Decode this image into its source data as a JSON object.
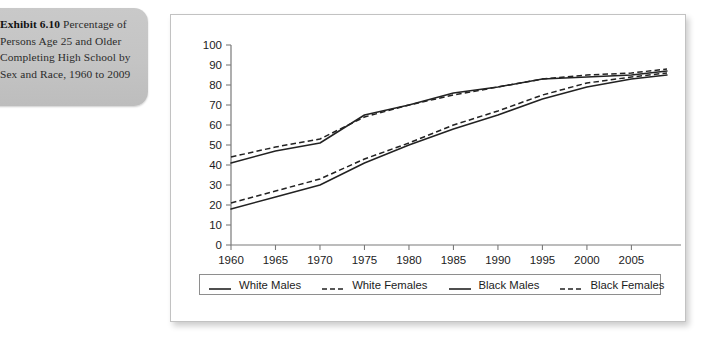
{
  "caption": {
    "exhibit_label": "Exhibit 6.10",
    "text": " Percentage of Persons Age 25 and Older Completing High School by Sex and Race, 1960 to 2009"
  },
  "legend": {
    "items": [
      {
        "label": "White Males",
        "style": "solid"
      },
      {
        "label": "White Females",
        "style": "dashed"
      },
      {
        "label": "Black Males",
        "style": "solid"
      },
      {
        "label": "Black Females",
        "style": "dashed"
      }
    ]
  },
  "chart_data": {
    "type": "line",
    "title": "Percentage of Persons Age 25 and Older Completing High School by Sex and Race, 1960 to 2009",
    "xlabel": "",
    "ylabel": "",
    "xlim": [
      1960,
      2009
    ],
    "ylim": [
      0,
      100
    ],
    "grid": false,
    "legend_position": "bottom",
    "xticks": [
      1960,
      1965,
      1970,
      1975,
      1980,
      1985,
      1990,
      1995,
      2000,
      2005
    ],
    "yticks": [
      0,
      10,
      20,
      30,
      40,
      50,
      60,
      70,
      80,
      90,
      100
    ],
    "x": [
      1960,
      1965,
      1970,
      1975,
      1980,
      1985,
      1990,
      1995,
      2000,
      2005,
      2009
    ],
    "series": [
      {
        "name": "White Males",
        "style": "solid",
        "values": [
          41,
          47,
          51,
          65,
          70,
          76,
          79,
          83,
          84,
          85,
          87
        ]
      },
      {
        "name": "White Females",
        "style": "dashed",
        "values": [
          44,
          49,
          53,
          64,
          70,
          75,
          79,
          83,
          85,
          86,
          88
        ]
      },
      {
        "name": "Black Males",
        "style": "solid",
        "values": [
          18,
          24,
          30,
          41,
          50,
          58,
          65,
          73,
          79,
          83,
          85
        ]
      },
      {
        "name": "Black Females",
        "style": "dashed",
        "values": [
          21,
          27,
          33,
          43,
          51,
          60,
          67,
          75,
          81,
          84,
          86
        ]
      }
    ]
  }
}
